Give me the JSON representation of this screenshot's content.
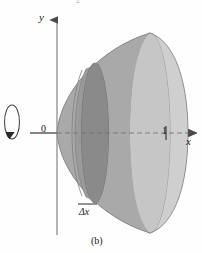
{
  "figure": {
    "caption": "(b)",
    "top_cut_label": "2",
    "axes": {
      "y_label": "y",
      "x_label": "x",
      "origin_label": "0",
      "x_tick_label": "1"
    },
    "annotations": {
      "slice_label": "Δx"
    },
    "icons": {
      "rotation_arrow": "rotation-arrow-icon",
      "x_axis_arrow": "arrow-right-icon",
      "y_axis_arrow": "arrow-up-icon"
    },
    "colors": {
      "background": "#fefefe",
      "axis": "#6f6f6f",
      "outline": "#7a7a7a",
      "solid_light": "#c9c9c9",
      "solid_mid": "#a8a8a8",
      "solid_dark": "#8e8e8e",
      "disk_dark": "#8a8a8a",
      "text": "#1b1b1b"
    },
    "geometry": {
      "description": "Solid of revolution: paraboloid opening rightward about the x-axis, with a representative circular cross-section disk of thickness delta-x",
      "axis_of_revolution": "x-axis",
      "x_tick_value": 1,
      "origin_px": [
        57,
        133
      ],
      "x_tick_px": [
        166,
        133
      ],
      "vertex_px": [
        57,
        133
      ],
      "right_rim_center_px": [
        150,
        133
      ],
      "slice_center_px": [
        95,
        133
      ]
    }
  }
}
